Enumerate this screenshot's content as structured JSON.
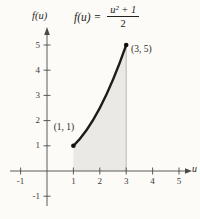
{
  "figure": {
    "formula": {
      "lhs": "f(u) =",
      "numerator": "u² + 1",
      "denominator": "2"
    },
    "y_axis_label": "f(u)",
    "x_axis_label": "u"
  },
  "chart_data": {
    "type": "area",
    "xlabel": "u",
    "ylabel": "f(u)",
    "x_ticks": [
      -1,
      1,
      2,
      3,
      4,
      5
    ],
    "y_ticks": [
      -1,
      1,
      2,
      3,
      4,
      5
    ],
    "xlim": [
      -1.4,
      5.6
    ],
    "ylim": [
      -1.8,
      5.7
    ],
    "grid": false,
    "curve": {
      "function": "f(u) = (u^2 + 1)/2",
      "domain": [
        1,
        3
      ],
      "bezier": {
        "p0": [
          1,
          1
        ],
        "c": [
          2,
          2
        ],
        "p1": [
          3,
          5
        ]
      },
      "sample_values": [
        [
          1,
          1
        ],
        [
          1.5,
          1.625
        ],
        [
          2,
          2.5
        ],
        [
          2.5,
          3.625
        ],
        [
          3,
          5
        ]
      ]
    },
    "shaded_region": {
      "from_u": 1,
      "to_u": 3,
      "bounded_below_by": "x-axis"
    },
    "points": [
      {
        "u": 1,
        "v": 1,
        "label": "(1, 1)"
      },
      {
        "u": 3,
        "v": 5,
        "label": "(3, 5)"
      }
    ],
    "colors": {
      "curve": "#1c1c1c",
      "axis": "#4a4a4a",
      "shade": "#eae9e5",
      "guide_line": "#b3b0ab",
      "text": "#2a2a2a"
    }
  }
}
